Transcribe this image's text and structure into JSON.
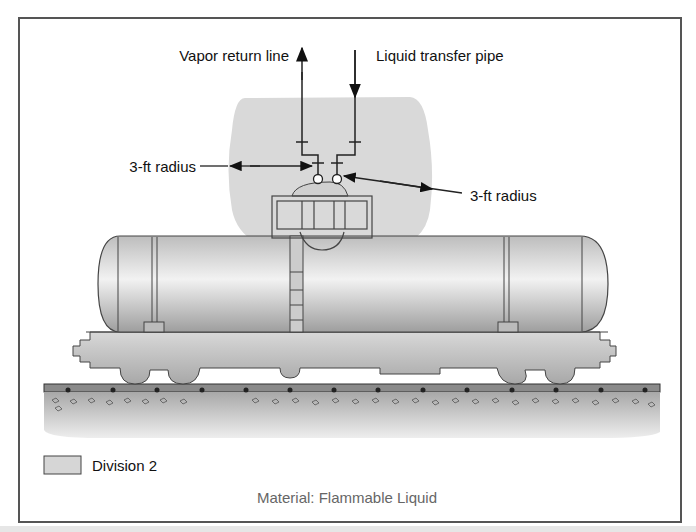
{
  "diagram": {
    "labels": {
      "vapor_return_line": "Vapor return line",
      "liquid_transfer_pipe": "Liquid transfer pipe",
      "radius_left": "3-ft radius",
      "radius_right": "3-ft radius"
    },
    "legend": {
      "swatch_color": "#d6d6d6",
      "label": "Division 2"
    },
    "caption": "Material: Flammable Liquid",
    "colors": {
      "zone": "#d9d9d9",
      "tank": "#c8c8c8",
      "ground": "#bdbdbd",
      "line": "#333333"
    }
  }
}
